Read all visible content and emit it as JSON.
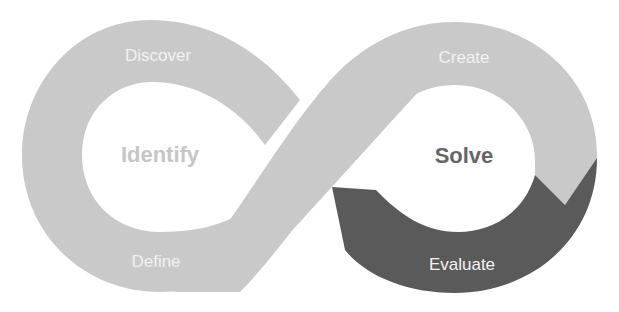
{
  "diagram": {
    "type": "infinity-loop",
    "colors": {
      "background": "#ffffff",
      "band_light": "#c9c9c9",
      "band_dark": "#5a5a5a",
      "band_text": "#f2f2f2",
      "identify_text": "#c6c6c6",
      "solve_text": "#666666"
    },
    "left_loop": {
      "hub_label": "Identify",
      "stages": [
        {
          "label": "Discover"
        },
        {
          "label": "Define"
        }
      ]
    },
    "right_loop": {
      "hub_label": "Solve",
      "stages": [
        {
          "label": "Create"
        },
        {
          "label": "Evaluate"
        }
      ]
    }
  }
}
